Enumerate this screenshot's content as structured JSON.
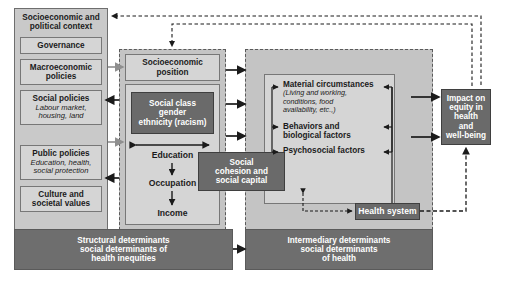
{
  "diagram": {
    "colors": {
      "dark_fill": "#6a6a6a",
      "light_fill": "#d5d5d5",
      "panel_fill": "#c9c9c9",
      "mid_fill": "#c0c0c0",
      "border": "#6e6e6e",
      "arrow_black": "#1b1b1b",
      "arrow_gray": "#8f8f8f"
    },
    "context": {
      "header": "Socioeconomic and\npolitical context",
      "header_line1": "Socioeconomic and",
      "header_line2": "political context",
      "items": [
        {
          "label": "Governance",
          "sub": ""
        },
        {
          "label": "Macroeconomic\npolicies",
          "label_line1": "Macroeconomic",
          "label_line2": "policies",
          "sub": ""
        },
        {
          "label": "Social policies",
          "sub": "Labour market,\nhousing, land",
          "sub_line1": "Labour market,",
          "sub_line2": "housing, land"
        },
        {
          "label": "Public policies",
          "sub": "Education, health,\nsocial protection",
          "sub_line1": "Education, health,",
          "sub_line2": "social protection"
        },
        {
          "label": "Culture and\nsocietal values",
          "label_line1": "Culture and",
          "label_line2": "societal values",
          "sub": ""
        }
      ]
    },
    "structural": {
      "position_line1": "Socioeconomic",
      "position_line2": "position",
      "social_class_line1": "Social class",
      "social_class_line2": "gender",
      "social_class_line3": "ethnicity (racism)",
      "chain": [
        "Education",
        "Occupation",
        "Income"
      ]
    },
    "cohesion": {
      "line1": "Social",
      "line2": "cohesion and",
      "line3": "social capital"
    },
    "intermediary": {
      "factors": [
        {
          "label": "Material circumstances",
          "detail_line1": "(Living and working,",
          "detail_line2": "conditions, food",
          "detail_line3": "availability, etc.,)"
        },
        {
          "label_line1": "Behaviors and",
          "label_line2": "biological factors"
        },
        {
          "label": "Psychosocial factors"
        }
      ],
      "health_system": "Health system"
    },
    "impact": {
      "line1": "Impact on",
      "line2": "equity in",
      "line3": "health",
      "line4": "and",
      "line5": "well-being"
    },
    "banners": {
      "structural_line1": "Structural determinants",
      "structural_line2": "social determinants of",
      "structural_line3": "health inequities",
      "intermediary_line1": "Intermediary determinants",
      "intermediary_line2": "social determinants",
      "intermediary_line3": "of health"
    }
  }
}
